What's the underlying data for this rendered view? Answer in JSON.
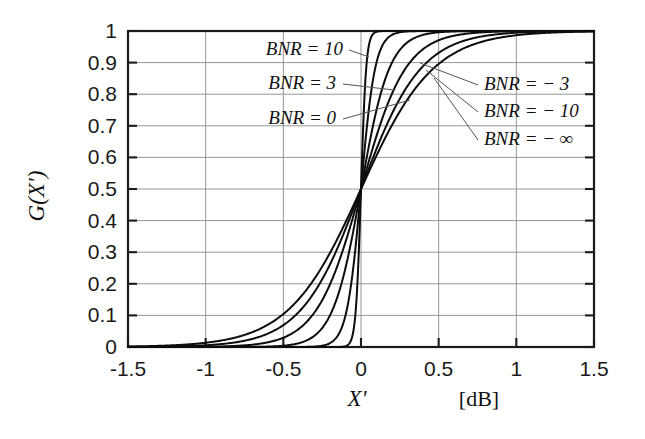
{
  "chart_data": {
    "type": "line",
    "title": "",
    "xlabel": "X'",
    "xunit": "[dB]",
    "ylabel": "G(X')",
    "xlim": [
      -1.5,
      1.5
    ],
    "ylim": [
      0,
      1
    ],
    "grid": true,
    "legend_position": "inline-annotations",
    "xticks": [
      "-1.5",
      "-1",
      "-0.5",
      "0",
      "0.5",
      "1",
      "1.5"
    ],
    "xtick_values": [
      -1.5,
      -1,
      -0.5,
      0,
      0.5,
      1,
      1.5
    ],
    "yticks": [
      "0",
      "0.1",
      "0.2",
      "0.3",
      "0.4",
      "0.5",
      "0.6",
      "0.7",
      "0.8",
      "0.9",
      "1"
    ],
    "ytick_values": [
      0,
      0.1,
      0.2,
      0.3,
      0.4,
      0.5,
      0.6,
      0.7,
      0.8,
      0.9,
      1
    ],
    "series": [
      {
        "name": "BNR = 10",
        "label": "BNR = 10",
        "steepness": 60.0,
        "x": [
          -1.5,
          -1.2,
          -0.9,
          -0.6,
          -0.4,
          -0.3,
          -0.2,
          -0.15,
          -0.1,
          -0.07,
          -0.05,
          -0.03,
          -0.02,
          -0.01,
          0,
          0.01,
          0.02,
          0.03,
          0.05,
          0.07,
          0.1,
          0.15,
          0.2,
          0.3,
          0.4,
          0.6,
          0.9,
          1.2,
          1.5
        ],
        "y": [
          0.0,
          0.0,
          0.0,
          0.0,
          0.0,
          0.0,
          0.0026,
          0.0111,
          0.0474,
          0.1301,
          0.2227,
          0.354,
          0.4256,
          0.5,
          0.5,
          0.5744,
          0.6457,
          0.7124,
          0.8176,
          0.8938,
          0.9526,
          0.9889,
          0.9975,
          1.0,
          1.0,
          1.0,
          1.0,
          1.0,
          1.0
        ]
      },
      {
        "name": "BNR = 3",
        "label": "BNR = 3",
        "steepness": 22.0,
        "x": [
          -1.5,
          -1.2,
          -0.9,
          -0.7,
          -0.5,
          -0.4,
          -0.3,
          -0.25,
          -0.2,
          -0.15,
          -0.1,
          -0.05,
          0,
          0.05,
          0.1,
          0.15,
          0.2,
          0.25,
          0.3,
          0.4,
          0.5,
          0.7,
          0.9,
          1.2,
          1.5
        ],
        "y": [
          0.0,
          0.0,
          0.0,
          0.0,
          0.0,
          0.0,
          0.0013,
          0.0037,
          0.0109,
          0.0314,
          0.0871,
          0.2227,
          0.5,
          0.7773,
          0.9129,
          0.9686,
          0.9891,
          0.9963,
          0.9987,
          0.9999,
          1.0,
          1.0,
          1.0,
          1.0,
          1.0
        ]
      },
      {
        "name": "BNR = 0",
        "label": "BNR = 0",
        "steepness": 11.0,
        "x": [
          -1.5,
          -1.2,
          -1.0,
          -0.8,
          -0.6,
          -0.5,
          -0.4,
          -0.3,
          -0.2,
          -0.1,
          0,
          0.1,
          0.2,
          0.3,
          0.4,
          0.5,
          0.6,
          0.8,
          1.0,
          1.2,
          1.5
        ],
        "y": [
          0.0,
          0.0,
          0.0,
          0.0002,
          0.0013,
          0.0041,
          0.0121,
          0.0351,
          0.0998,
          0.2502,
          0.5,
          0.7498,
          0.9002,
          0.9649,
          0.9879,
          0.9959,
          0.9987,
          0.9998,
          1.0,
          1.0,
          1.0
        ]
      },
      {
        "name": "BNR = -3",
        "label": "BNR = - 3",
        "steepness": 7.0,
        "x": [
          -1.5,
          -1.2,
          -1.0,
          -0.8,
          -0.6,
          -0.5,
          -0.4,
          -0.3,
          -0.2,
          -0.1,
          0,
          0.1,
          0.2,
          0.3,
          0.4,
          0.5,
          0.6,
          0.8,
          1.0,
          1.2,
          1.5
        ],
        "y": [
          0.0,
          0.0002,
          0.0009,
          0.0037,
          0.0148,
          0.0293,
          0.0567,
          0.1071,
          0.1974,
          0.3318,
          0.5,
          0.6682,
          0.8026,
          0.8929,
          0.9433,
          0.9707,
          0.9852,
          0.9963,
          0.9991,
          0.9998,
          1.0
        ]
      },
      {
        "name": "BNR = -10",
        "label": "BNR = - 10",
        "steepness": 5.2,
        "x": [
          -1.5,
          -1.2,
          -1.0,
          -0.8,
          -0.6,
          -0.5,
          -0.4,
          -0.3,
          -0.2,
          -0.1,
          0,
          0.1,
          0.2,
          0.3,
          0.4,
          0.5,
          0.6,
          0.8,
          1.0,
          1.2,
          1.5
        ],
        "y": [
          0.0004,
          0.0019,
          0.0055,
          0.0154,
          0.0424,
          0.0691,
          0.1109,
          0.1742,
          0.2637,
          0.3782,
          0.5,
          0.6218,
          0.7363,
          0.8258,
          0.8891,
          0.9309,
          0.9576,
          0.9846,
          0.9945,
          0.9981,
          0.9996
        ]
      },
      {
        "name": "BNR = -inf",
        "label": "BNR = - ∞",
        "steepness": 4.3,
        "x": [
          -1.5,
          -1.2,
          -1.0,
          -0.8,
          -0.6,
          -0.5,
          -0.4,
          -0.3,
          -0.2,
          -0.1,
          0,
          0.1,
          0.2,
          0.3,
          0.4,
          0.5,
          0.6,
          0.8,
          1.0,
          1.2,
          1.5
        ],
        "y": [
          0.0016,
          0.0057,
          0.0134,
          0.0311,
          0.0707,
          0.1045,
          0.1517,
          0.2155,
          0.2975,
          0.3941,
          0.5,
          0.6059,
          0.7025,
          0.7845,
          0.8483,
          0.8955,
          0.9293,
          0.9689,
          0.9866,
          0.9943,
          0.9984
        ]
      }
    ]
  },
  "annotations": {
    "left": [
      {
        "id": "bnr-10",
        "text": "BNR = 10",
        "x": 343,
        "y": 55,
        "anchor": "end",
        "leader": [
          [
            349,
            50
          ],
          [
            369,
            57
          ]
        ]
      },
      {
        "id": "bnr-3",
        "text": "BNR = 3",
        "x": 336,
        "y": 89,
        "anchor": "end",
        "leader": [
          [
            343,
            84
          ],
          [
            394,
            90
          ]
        ]
      },
      {
        "id": "bnr-0",
        "text": "BNR = 0",
        "x": 336,
        "y": 124,
        "anchor": "end",
        "leader": [
          [
            343,
            119
          ],
          [
            410,
            100
          ]
        ]
      }
    ],
    "right": [
      {
        "id": "bnr-neg3",
        "text": "BNR = − 3",
        "x": 484,
        "y": 90,
        "anchor": "start",
        "leader": [
          [
            478,
            85
          ],
          [
            420,
            63
          ]
        ]
      },
      {
        "id": "bnr-neg10",
        "text": "BNR = − 10",
        "x": 484,
        "y": 117,
        "anchor": "start",
        "leader": [
          [
            478,
            112
          ],
          [
            426,
            70
          ]
        ]
      },
      {
        "id": "bnr-neginf",
        "text": "BNR = − ∞",
        "x": 484,
        "y": 145,
        "anchor": "start",
        "leader": [
          [
            478,
            140
          ],
          [
            434,
            78
          ]
        ]
      }
    ]
  },
  "colors": {
    "curve": "#0d0d0d",
    "grid": "#8a8a8a",
    "frame": "#1c1c1c",
    "text": "#111111",
    "background": "#ffffff"
  },
  "geometry": {
    "plot_left": 128,
    "plot_right": 594,
    "plot_top": 31,
    "plot_bottom": 347
  }
}
